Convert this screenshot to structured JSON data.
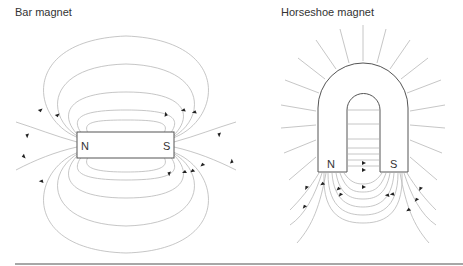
{
  "panels": [
    {
      "title": "Bar magnet",
      "poles": {
        "left": "N",
        "right": "S"
      }
    },
    {
      "title": "Horseshoe magnet",
      "poles": {
        "left": "N",
        "right": "S"
      }
    }
  ],
  "colors": {
    "field_lines": "#b8b8b8",
    "magnet_outline": "#555555",
    "arrows": "#222222",
    "rule": "#8a8a8a"
  }
}
